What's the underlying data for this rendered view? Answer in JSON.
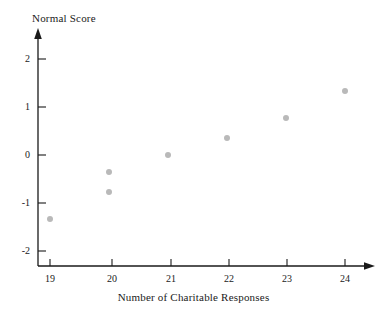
{
  "chart_data": {
    "type": "scatter",
    "title": "",
    "xlabel": "Number of Charitable Responses",
    "ylabel": "Normal Score",
    "xlim": [
      18.45,
      24.55
    ],
    "ylim": [
      -2.3,
      2.4
    ],
    "xticks": [
      19,
      20,
      21,
      22,
      23,
      24
    ],
    "xtick_labels": [
      "19",
      "20",
      "21",
      "22",
      "23",
      "24"
    ],
    "yticks": [
      2,
      1,
      0,
      -1,
      -2
    ],
    "ytick_labels": [
      "2",
      "1",
      "0",
      "-1",
      "-2"
    ],
    "grid": false,
    "legend": null,
    "marker_color": "#b9b9b9",
    "axis_color": "#1a1a1a",
    "points": [
      {
        "x": 19,
        "y": -1.33
      },
      {
        "x": 20,
        "y": -0.35
      },
      {
        "x": 20,
        "y": -0.77
      },
      {
        "x": 21,
        "y": 0.0
      },
      {
        "x": 22,
        "y": 0.35
      },
      {
        "x": 23,
        "y": 0.77
      },
      {
        "x": 24,
        "y": 1.33
      }
    ],
    "x": [
      19,
      20,
      20,
      21,
      22,
      23,
      24
    ],
    "values": [
      -1.33,
      -0.35,
      -0.77,
      0.0,
      0.35,
      0.77,
      1.33
    ]
  }
}
